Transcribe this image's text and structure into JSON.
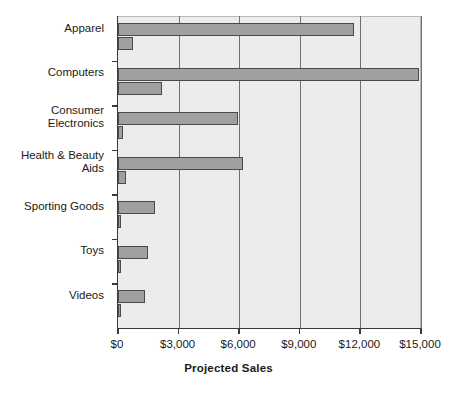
{
  "chart_data": {
    "type": "bar",
    "orientation": "horizontal",
    "title": "",
    "xlabel": "Projected Sales",
    "ylabel": "",
    "xlim": [
      0,
      15000
    ],
    "ylim": null,
    "grid": true,
    "legend": "none",
    "xticks": [
      "$0",
      "$3,000",
      "$6,000",
      "$9,000",
      "$12,000",
      "$15,000"
    ],
    "xtick_values": [
      0,
      3000,
      6000,
      9000,
      12000,
      15000
    ],
    "categories": [
      "Apparel",
      "Computers",
      "Consumer\nElectronics",
      "Health & Beauty\nAids",
      "Sporting Goods",
      "Toys",
      "Videos"
    ],
    "series": [
      {
        "name": "series-1",
        "values": [
          11700,
          14900,
          5950,
          6200,
          1840,
          1480,
          1350
        ]
      },
      {
        "name": "series-2",
        "values": [
          740,
          2180,
          230,
          400,
          150,
          150,
          170
        ]
      }
    ],
    "colors": {
      "bar_fill": "#a0a0a0",
      "bar_stroke": "#4a4a4a",
      "plot_background": "#ececec",
      "gridline": "#6f6f6f",
      "axis": "#3a3a3a",
      "text": "#1a1a1a",
      "page_background": "#ffffff"
    }
  }
}
